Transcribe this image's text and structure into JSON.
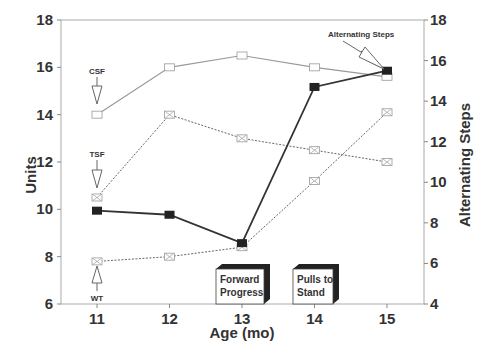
{
  "chart_data": {
    "type": "line",
    "title": "",
    "xlabel": "Age (mo)",
    "ylabel": "Units",
    "y2label": "Alternating Steps",
    "x": [
      11,
      12,
      13,
      14,
      15
    ],
    "xlim": [
      11,
      15
    ],
    "ylim": [
      6,
      18
    ],
    "y2lim": [
      4,
      18
    ],
    "x_ticks": [
      "11",
      "12",
      "13",
      "14",
      "15"
    ],
    "y_ticks": [
      "6",
      "8",
      "10",
      "12",
      "14",
      "16",
      "18"
    ],
    "y2_ticks": [
      "4",
      "6",
      "8",
      "10",
      "12",
      "14",
      "16",
      "18"
    ],
    "grid": false,
    "legend": "inline annotations with arrows",
    "series": [
      {
        "name": "CSF",
        "axis": "left",
        "marker": "open-square",
        "line": "solid-thin",
        "values": [
          14.0,
          16.0,
          16.5,
          16.0,
          15.6
        ]
      },
      {
        "name": "TSF",
        "axis": "left",
        "marker": "boxed-x",
        "line": "dotted",
        "values": [
          10.5,
          14.0,
          13.0,
          12.5,
          12.0
        ]
      },
      {
        "name": "WT",
        "axis": "left",
        "marker": "x-square",
        "line": "dotted",
        "values": [
          7.8,
          8.0,
          8.4,
          11.2,
          14.1
        ]
      },
      {
        "name": "Alternating Steps",
        "axis": "right",
        "marker": "filled-square",
        "line": "solid-thick",
        "values": [
          8.6,
          8.4,
          7.0,
          14.7,
          15.5
        ]
      }
    ],
    "annotations": [
      {
        "text": "CSF",
        "x": 11,
        "arrow_to": "CSF@11"
      },
      {
        "text": "TSF",
        "x": 11,
        "arrow_to": "TSF@11"
      },
      {
        "text": "WT",
        "x": 11,
        "arrow_to": "WT@11"
      },
      {
        "text": "Alternating Steps",
        "x": 15,
        "arrow_to": "Alternating Steps@15"
      }
    ],
    "milestones": [
      {
        "label_line1": "Forward",
        "label_line2": "Progress",
        "x": 13
      },
      {
        "label_line1": "Pulls to",
        "label_line2": "Stand",
        "x": 14
      }
    ]
  },
  "labels": {
    "xlabel": "Age (mo)",
    "ylabel": "Units",
    "y2label": "Alternating Steps",
    "csf": "CSF",
    "tsf": "TSF",
    "wt": "WT",
    "alt": "Alternating Steps",
    "m1a": "Forward",
    "m1b": "Progress",
    "m2a": "Pulls to",
    "m2b": "Stand"
  }
}
